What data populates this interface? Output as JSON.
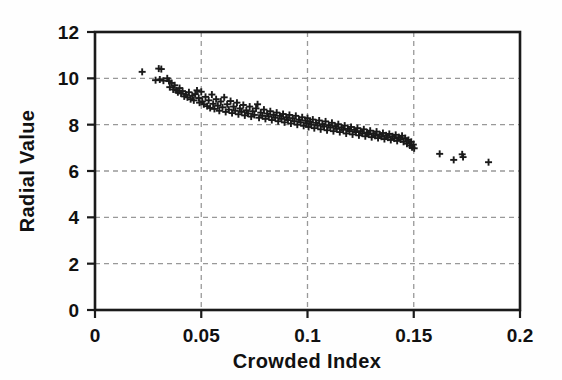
{
  "chart_data": {
    "type": "scatter",
    "title": "",
    "subtitle": "",
    "xlabel": "Crowded Index",
    "ylabel": "Radial Value",
    "xlim": [
      0,
      0.2
    ],
    "ylim": [
      0,
      12
    ],
    "xticks": [
      0,
      0.05,
      0.1,
      0.15,
      0.2
    ],
    "xtick_labels": [
      "0",
      "0.05",
      "0.1",
      "0.15",
      "0.2"
    ],
    "yticks": [
      0,
      2,
      4,
      6,
      8,
      10,
      12
    ],
    "ytick_labels": [
      "0",
      "2",
      "4",
      "6",
      "8",
      "10",
      "12"
    ],
    "grid": true,
    "grid_style": "dashed",
    "grid_color": "#999999",
    "legend": false,
    "legend_position": "none",
    "marker": "plus",
    "marker_color": "#1a1a1a",
    "marker_size": 7,
    "axis_color": "#1a1a1a",
    "background_color": "#ffffff",
    "series": [
      {
        "name": "Radial Value",
        "points": [
          [
            0.0222,
            10.28
          ],
          [
            0.0285,
            9.92
          ],
          [
            0.03,
            10.42
          ],
          [
            0.0312,
            10.4
          ],
          [
            0.0305,
            9.95
          ],
          [
            0.0322,
            9.9
          ],
          [
            0.034,
            10.0
          ],
          [
            0.0348,
            9.88
          ],
          [
            0.0352,
            9.62
          ],
          [
            0.036,
            9.8
          ],
          [
            0.0368,
            9.52
          ],
          [
            0.0375,
            9.7
          ],
          [
            0.0382,
            9.48
          ],
          [
            0.039,
            9.4
          ],
          [
            0.0398,
            9.58
          ],
          [
            0.0405,
            9.35
          ],
          [
            0.0412,
            9.45
          ],
          [
            0.042,
            9.22
          ],
          [
            0.0428,
            9.3
          ],
          [
            0.0435,
            9.18
          ],
          [
            0.0442,
            9.4
          ],
          [
            0.045,
            9.1
          ],
          [
            0.0458,
            9.25
          ],
          [
            0.0465,
            9.05
          ],
          [
            0.0472,
            9.32
          ],
          [
            0.048,
            9.48
          ],
          [
            0.0488,
            9.15
          ],
          [
            0.0492,
            8.95
          ],
          [
            0.05,
            9.42
          ],
          [
            0.0505,
            9.0
          ],
          [
            0.0512,
            8.88
          ],
          [
            0.052,
            9.2
          ],
          [
            0.0528,
            8.8
          ],
          [
            0.0535,
            9.05
          ],
          [
            0.0542,
            8.72
          ],
          [
            0.055,
            9.3
          ],
          [
            0.0556,
            8.9
          ],
          [
            0.0562,
            8.68
          ],
          [
            0.057,
            9.1
          ],
          [
            0.0578,
            8.82
          ],
          [
            0.0585,
            8.6
          ],
          [
            0.0592,
            9.0
          ],
          [
            0.06,
            8.75
          ],
          [
            0.0608,
            9.18
          ],
          [
            0.0615,
            8.55
          ],
          [
            0.0622,
            8.88
          ],
          [
            0.063,
            8.65
          ],
          [
            0.0638,
            9.02
          ],
          [
            0.0645,
            8.5
          ],
          [
            0.0652,
            8.78
          ],
          [
            0.066,
            8.6
          ],
          [
            0.0668,
            8.95
          ],
          [
            0.0675,
            8.45
          ],
          [
            0.0682,
            8.7
          ],
          [
            0.069,
            8.55
          ],
          [
            0.0698,
            8.85
          ],
          [
            0.0705,
            8.4
          ],
          [
            0.0712,
            8.62
          ],
          [
            0.072,
            8.48
          ],
          [
            0.0728,
            8.78
          ],
          [
            0.0735,
            8.35
          ],
          [
            0.0742,
            8.58
          ],
          [
            0.075,
            8.42
          ],
          [
            0.0758,
            8.7
          ],
          [
            0.0765,
            8.88
          ],
          [
            0.0772,
            8.3
          ],
          [
            0.078,
            8.52
          ],
          [
            0.0788,
            8.38
          ],
          [
            0.0795,
            8.65
          ],
          [
            0.0802,
            8.25
          ],
          [
            0.081,
            8.48
          ],
          [
            0.0818,
            8.35
          ],
          [
            0.0825,
            8.58
          ],
          [
            0.0832,
            8.2
          ],
          [
            0.084,
            8.42
          ],
          [
            0.0848,
            8.3
          ],
          [
            0.0855,
            8.52
          ],
          [
            0.0862,
            8.15
          ],
          [
            0.087,
            8.38
          ],
          [
            0.0878,
            8.25
          ],
          [
            0.0885,
            8.46
          ],
          [
            0.0892,
            8.1
          ],
          [
            0.09,
            8.32
          ],
          [
            0.0908,
            8.2
          ],
          [
            0.0915,
            8.42
          ],
          [
            0.0922,
            8.05
          ],
          [
            0.093,
            8.28
          ],
          [
            0.0938,
            8.15
          ],
          [
            0.0945,
            8.38
          ],
          [
            0.0952,
            8.0
          ],
          [
            0.096,
            8.22
          ],
          [
            0.0968,
            8.1
          ],
          [
            0.0975,
            8.32
          ],
          [
            0.0982,
            7.95
          ],
          [
            0.099,
            8.18
          ],
          [
            0.0995,
            8.05
          ],
          [
            0.1,
            8.28
          ],
          [
            0.1005,
            7.9
          ],
          [
            0.1012,
            8.12
          ],
          [
            0.1018,
            8.0
          ],
          [
            0.1025,
            8.22
          ],
          [
            0.1032,
            7.85
          ],
          [
            0.104,
            8.08
          ],
          [
            0.1048,
            7.96
          ],
          [
            0.1055,
            8.18
          ],
          [
            0.1062,
            7.8
          ],
          [
            0.107,
            8.02
          ],
          [
            0.1078,
            7.92
          ],
          [
            0.1085,
            8.14
          ],
          [
            0.1092,
            7.76
          ],
          [
            0.11,
            7.98
          ],
          [
            0.1108,
            7.88
          ],
          [
            0.1115,
            8.08
          ],
          [
            0.1122,
            7.72
          ],
          [
            0.113,
            7.94
          ],
          [
            0.1138,
            7.82
          ],
          [
            0.1145,
            8.02
          ],
          [
            0.1152,
            7.68
          ],
          [
            0.116,
            7.88
          ],
          [
            0.1168,
            7.78
          ],
          [
            0.1175,
            7.96
          ],
          [
            0.1182,
            7.62
          ],
          [
            0.119,
            7.82
          ],
          [
            0.1198,
            7.72
          ],
          [
            0.1205,
            7.9
          ],
          [
            0.1212,
            7.58
          ],
          [
            0.122,
            7.78
          ],
          [
            0.1228,
            7.68
          ],
          [
            0.1235,
            7.85
          ],
          [
            0.1242,
            7.54
          ],
          [
            0.125,
            7.72
          ],
          [
            0.1258,
            7.62
          ],
          [
            0.1265,
            7.8
          ],
          [
            0.1272,
            7.5
          ],
          [
            0.128,
            7.66
          ],
          [
            0.1288,
            7.58
          ],
          [
            0.1295,
            7.74
          ],
          [
            0.1302,
            7.46
          ],
          [
            0.131,
            7.62
          ],
          [
            0.1318,
            7.52
          ],
          [
            0.1325,
            7.7
          ],
          [
            0.1332,
            7.42
          ],
          [
            0.134,
            7.58
          ],
          [
            0.1348,
            7.48
          ],
          [
            0.1355,
            7.64
          ],
          [
            0.1362,
            7.38
          ],
          [
            0.137,
            7.54
          ],
          [
            0.1378,
            7.44
          ],
          [
            0.1385,
            7.6
          ],
          [
            0.1392,
            7.34
          ],
          [
            0.14,
            7.5
          ],
          [
            0.1408,
            7.4
          ],
          [
            0.1415,
            7.56
          ],
          [
            0.1422,
            7.3
          ],
          [
            0.143,
            7.46
          ],
          [
            0.1438,
            7.36
          ],
          [
            0.1445,
            7.52
          ],
          [
            0.1452,
            7.26
          ],
          [
            0.146,
            7.42
          ],
          [
            0.1468,
            7.18
          ],
          [
            0.1475,
            7.34
          ],
          [
            0.1482,
            7.1
          ],
          [
            0.1488,
            7.26
          ],
          [
            0.1492,
            7.02
          ],
          [
            0.1498,
            7.14
          ],
          [
            0.1502,
            6.98
          ],
          [
            0.1622,
            6.74
          ],
          [
            0.1688,
            6.48
          ],
          [
            0.1728,
            6.72
          ],
          [
            0.1732,
            6.6
          ],
          [
            0.1852,
            6.38
          ]
        ]
      }
    ]
  },
  "axes": {
    "x_title": "Crowded Index",
    "y_title": "Radial Value"
  }
}
